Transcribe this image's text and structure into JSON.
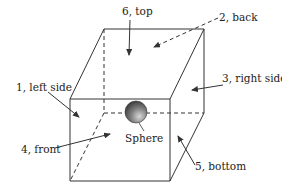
{
  "diagram": {
    "labels": {
      "top": "6, top",
      "back": "2, back",
      "left": "1, left side",
      "right": "3, right side",
      "front": "4, front",
      "bottom": "5, bottom",
      "sphere": "Sphere"
    },
    "colors": {
      "line": "#333333",
      "sphere_light": "#d8d8d8",
      "sphere_dark": "#303030"
    }
  }
}
